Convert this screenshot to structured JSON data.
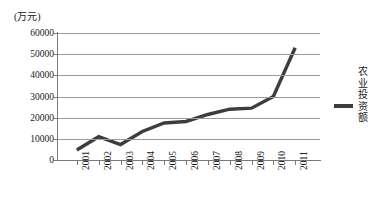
{
  "chart_data": {
    "type": "line",
    "title": "",
    "unit_label": "(万元)",
    "xlabel": "",
    "ylabel": "",
    "categories": [
      "2001",
      "2002",
      "2003",
      "2004",
      "2005",
      "2006",
      "2007",
      "2008",
      "2009",
      "2010",
      "2011"
    ],
    "series": [
      {
        "name": "农业投资额",
        "color": "#3d3d3d",
        "values": [
          4700,
          11000,
          7300,
          13500,
          17500,
          18200,
          21500,
          24000,
          24500,
          30000,
          53000
        ]
      }
    ],
    "ylim": [
      0,
      60000
    ],
    "yticks": [
      60000,
      50000,
      40000,
      30000,
      20000,
      10000,
      0
    ],
    "ytick_labels": [
      "60000",
      "50000",
      "40000",
      "30000",
      "20000",
      "10000",
      "0"
    ],
    "grid": true,
    "grid_axis": "y",
    "legend_position": "right",
    "legend_entries": [
      "农业投资额"
    ]
  },
  "colors": {
    "line": "#3d3d3d",
    "grid": "#9a9a9a",
    "axis": "#7a7a7a",
    "text": "#1a1a1a",
    "background": "#ffffff"
  }
}
